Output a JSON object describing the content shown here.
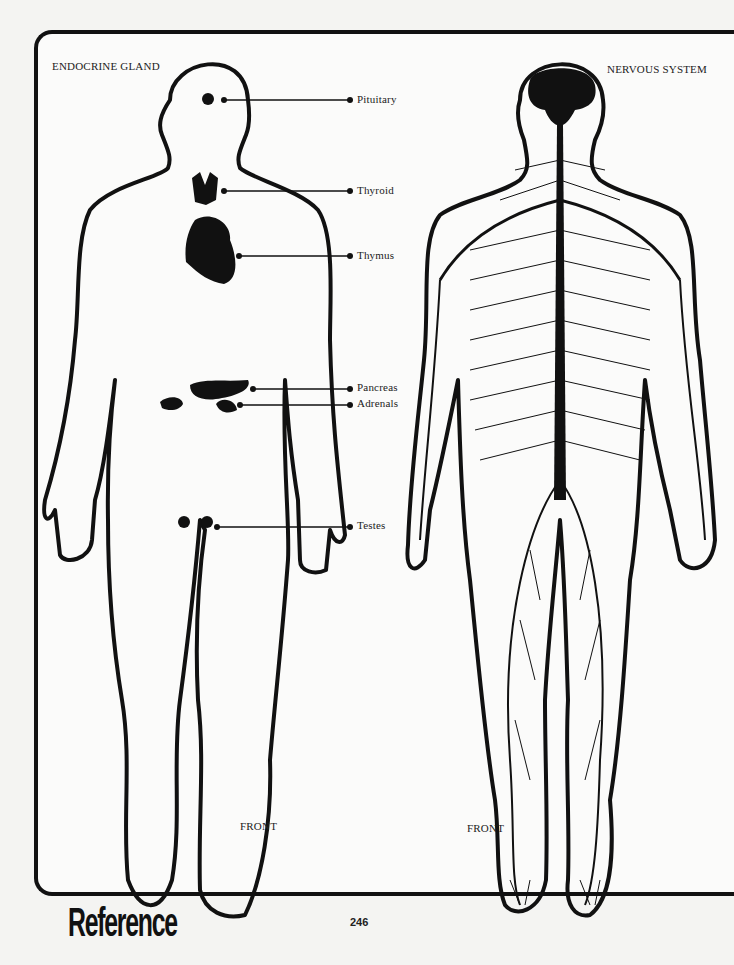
{
  "endocrine": {
    "title": "ENDOCRINE GLAND",
    "view_label": "FRONT",
    "glands": [
      {
        "name": "Pituitary"
      },
      {
        "name": "Thyroid"
      },
      {
        "name": "Thymus"
      },
      {
        "name": "Pancreas"
      },
      {
        "name": "Adrenals"
      },
      {
        "name": "Testes"
      }
    ]
  },
  "nervous": {
    "title": "NERVOUS SYSTEM",
    "view_label": "FRONT"
  },
  "footer": {
    "section_title": "Reference",
    "page_number": "246"
  },
  "colors": {
    "ink": "#111111",
    "paper": "#fbfbfa"
  }
}
